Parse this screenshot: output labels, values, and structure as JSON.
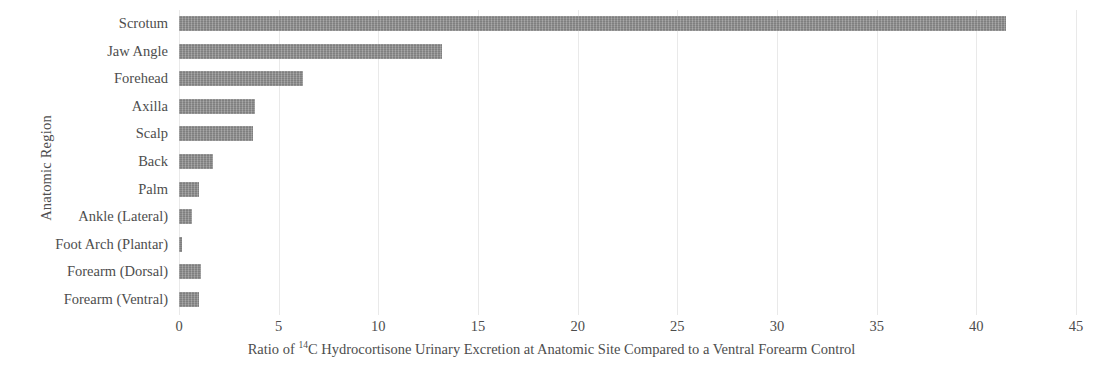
{
  "chart_data": {
    "type": "bar",
    "orientation": "horizontal",
    "title": "",
    "xlabel_prefix": "Ratio of ",
    "xlabel_superscript": "14",
    "xlabel_suffix": "C Hydrocortisone Urinary Excretion at Anatomic Site Compared to a Ventral Forearm Control",
    "xlabel": "Ratio of 14C Hydrocortisone Urinary Excretion at Anatomic Site Compared to a Ventral Forearm Control",
    "ylabel": "Anatomic Region",
    "categories": [
      "Scrotum",
      "Jaw Angle",
      "Forehead",
      "Axilla",
      "Scalp",
      "Back",
      "Palm",
      "Ankle (Lateral)",
      "Foot Arch (Plantar)",
      "Forearm (Dorsal)",
      "Forearm (Ventral)"
    ],
    "values": [
      41.5,
      13.2,
      6.2,
      3.8,
      3.7,
      1.7,
      1.0,
      0.65,
      0.14,
      1.1,
      1.0
    ],
    "xlim": [
      0,
      45
    ],
    "xticks": [
      0,
      5,
      10,
      15,
      20,
      25,
      30,
      35,
      40,
      45
    ],
    "xtick_labels": [
      "0",
      "5",
      "10",
      "15",
      "20",
      "25",
      "30",
      "35",
      "40",
      "45"
    ],
    "grid": true,
    "grid_axis": "x",
    "legend": false,
    "bar_color": "#8b8b8b",
    "grid_color": "#e9e9e9",
    "text_color": "#4d4d4d"
  }
}
